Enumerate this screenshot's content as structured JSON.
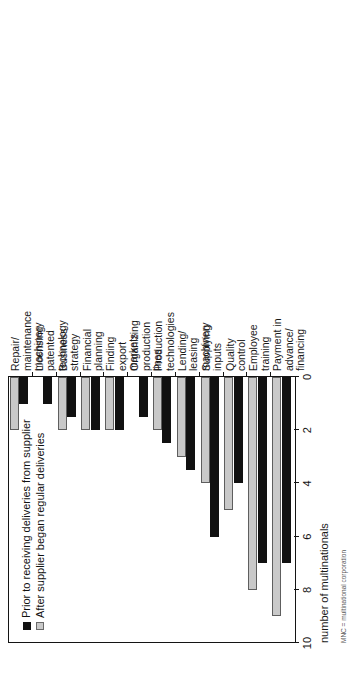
{
  "chart_data": {
    "type": "bar",
    "orientation": "horizontal",
    "title": "",
    "xlabel": "number of multinationals",
    "ylabel": "",
    "xlim": [
      0,
      10
    ],
    "xticks": [
      10,
      8,
      6,
      4,
      2,
      0
    ],
    "grid": false,
    "legend_position": "top-left",
    "categories": [
      "Payment in advance/\nfinancing",
      "Employee\ntraining",
      "Quality\ncontrol",
      "Supplying\ninputs",
      "Lending/\nleasing\nmachinery",
      "Production\ntechnologies",
      "Organizing\nproduction\nlines",
      "Finding\nexport\nmarkets",
      "Financial\nplanning",
      "Business\nstrategy",
      "Licensing\npatented\ntechnology",
      "Repair/\nmaintenance\nmachinery"
    ],
    "series": [
      {
        "name": "Prior to receiving deliveries from supplier",
        "color": "#111111",
        "values": [
          7,
          7,
          4,
          6,
          3.5,
          2.5,
          1.5,
          2,
          2,
          1.5,
          1,
          1
        ]
      },
      {
        "name": "After supplier began regular deliveries",
        "color": "#c9c9c9",
        "values": [
          9,
          8,
          5,
          4,
          3,
          2,
          0,
          2,
          2,
          2,
          0,
          2
        ]
      }
    ]
  },
  "legend": {
    "items": [
      {
        "label": "Prior to receiving deliveries from supplier",
        "swatch": "dark"
      },
      {
        "label": "After supplier began regular deliveries",
        "swatch": "light"
      }
    ]
  },
  "axis": {
    "value_axis_title": "number of multinationals"
  },
  "caption": {
    "text": "MNC = multinational corporation"
  }
}
